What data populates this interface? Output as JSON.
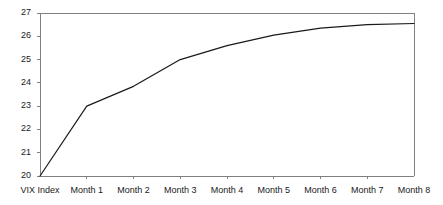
{
  "chart_data": {
    "type": "line",
    "title": "",
    "subtitle": "",
    "xlabel": "",
    "ylabel": "",
    "categories": [
      "VIX Index",
      "Month 1",
      "Month 2",
      "Month 3",
      "Month 4",
      "Month 5",
      "Month 6",
      "Month 7",
      "Month 8"
    ],
    "values": [
      20.0,
      23.0,
      23.85,
      25.0,
      25.6,
      26.05,
      26.35,
      26.5,
      26.55
    ],
    "series": [
      {
        "name": "VIX futures term structure",
        "values": [
          20.0,
          23.0,
          23.85,
          25.0,
          25.6,
          26.05,
          26.35,
          26.5,
          26.55
        ]
      }
    ],
    "ylim": [
      20,
      27
    ],
    "yticks": [
      20,
      21,
      22,
      23,
      24,
      25,
      26,
      27
    ],
    "ytick_labels": [
      "20",
      "21",
      "22",
      "23",
      "24",
      "25",
      "26",
      "27"
    ],
    "xtick_labels": [
      "VIX Index",
      "Month 1",
      "Month 2",
      "Month 3",
      "Month 4",
      "Month 5",
      "Month 6",
      "Month 7",
      "Month 8"
    ],
    "grid": false,
    "legend": false,
    "legend_position": "none",
    "line_color": "#1a1a1a",
    "axis_color": "#808080",
    "plot_background": "#ffffff",
    "annotations": []
  },
  "axes": {
    "y_axis_name": "value-axis",
    "x_axis_name": "category-axis"
  }
}
